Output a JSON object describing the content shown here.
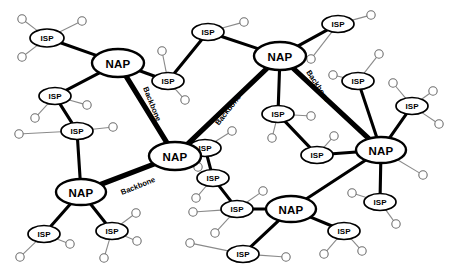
{
  "diagram": {
    "type": "network-diagram",
    "width": 450,
    "height": 275,
    "background_color": "#ffffff",
    "colors": {
      "backbone_link": "#000000",
      "isp_link": "#000000",
      "leaf_link": "#8a8a8a",
      "node_fill": "#ffffff",
      "node_stroke": "#000000",
      "leaf_stroke": "#6f6f6f",
      "label_text": "#000000"
    },
    "labels": {
      "nap": "NAP",
      "isp": "ISP",
      "backbone": "Backbone"
    },
    "nap_nodes": [
      {
        "id": "nap-top-left",
        "label": "NAP",
        "x": 118,
        "y": 63,
        "rx": 26,
        "ry": 14
      },
      {
        "id": "nap-top-right",
        "label": "NAP",
        "x": 280,
        "y": 56,
        "rx": 26,
        "ry": 14
      },
      {
        "id": "nap-center",
        "label": "NAP",
        "x": 175,
        "y": 156,
        "rx": 26,
        "ry": 14
      },
      {
        "id": "nap-left",
        "label": "NAP",
        "x": 81,
        "y": 192,
        "rx": 25,
        "ry": 13
      },
      {
        "id": "nap-right",
        "label": "NAP",
        "x": 381,
        "y": 150,
        "rx": 25,
        "ry": 13
      },
      {
        "id": "nap-bottom",
        "label": "NAP",
        "x": 291,
        "y": 209,
        "rx": 25,
        "ry": 13
      }
    ],
    "isp_nodes": [
      {
        "id": "isp-01",
        "label": "ISP",
        "x": 47,
        "y": 38,
        "rx": 17,
        "ry": 9
      },
      {
        "id": "isp-02",
        "label": "ISP",
        "x": 55,
        "y": 96,
        "rx": 16,
        "ry": 8.5
      },
      {
        "id": "isp-03",
        "label": "ISP",
        "x": 77,
        "y": 131,
        "rx": 16,
        "ry": 8.5
      },
      {
        "id": "isp-04",
        "label": "ISP",
        "x": 208,
        "y": 32,
        "rx": 16,
        "ry": 8.5
      },
      {
        "id": "isp-05",
        "label": "ISP",
        "x": 168,
        "y": 81,
        "rx": 16,
        "ry": 8.5
      },
      {
        "id": "isp-06",
        "label": "ISP",
        "x": 338,
        "y": 24,
        "rx": 16,
        "ry": 8.5
      },
      {
        "id": "isp-07",
        "label": "ISP",
        "x": 358,
        "y": 81,
        "rx": 16,
        "ry": 8.5
      },
      {
        "id": "isp-08",
        "label": "ISP",
        "x": 412,
        "y": 106,
        "rx": 16,
        "ry": 8.5
      },
      {
        "id": "isp-09",
        "label": "ISP",
        "x": 278,
        "y": 114,
        "rx": 16,
        "ry": 8.5
      },
      {
        "id": "isp-10",
        "label": "ISP",
        "x": 317,
        "y": 155,
        "rx": 16,
        "ry": 8.5
      },
      {
        "id": "isp-11",
        "label": "ISP",
        "x": 213,
        "y": 178,
        "rx": 16,
        "ry": 8.5
      },
      {
        "id": "isp-12",
        "label": "ISP",
        "x": 237,
        "y": 209,
        "rx": 16,
        "ry": 8.5
      },
      {
        "id": "isp-13",
        "label": "ISP",
        "x": 243,
        "y": 254,
        "rx": 16,
        "ry": 8.5
      },
      {
        "id": "isp-14",
        "label": "ISP",
        "x": 380,
        "y": 202,
        "rx": 16,
        "ry": 8.5
      },
      {
        "id": "isp-15",
        "label": "ISP",
        "x": 344,
        "y": 231,
        "rx": 16,
        "ry": 8.5
      },
      {
        "id": "isp-16",
        "label": "ISP",
        "x": 44,
        "y": 234,
        "rx": 16,
        "ry": 8.5
      },
      {
        "id": "isp-17",
        "label": "ISP",
        "x": 112,
        "y": 231,
        "rx": 16,
        "ry": 8.5
      },
      {
        "id": "isp-18",
        "label": "ISP",
        "x": 205,
        "y": 148,
        "rx": 16,
        "ry": 8.5
      }
    ],
    "backbone_links": [
      {
        "id": "bb-tl-center",
        "from": "nap-top-left",
        "to": "nap-center",
        "label": "Backbone",
        "label_x": 152,
        "label_y": 104,
        "label_rotation": 68
      },
      {
        "id": "bb-center-tr",
        "from": "nap-center",
        "to": "nap-top-right",
        "label": "Backbone",
        "label_x": 228,
        "label_y": 110,
        "label_rotation": -52
      },
      {
        "id": "bb-tr-right",
        "from": "nap-top-right",
        "to": "nap-right",
        "label": "Backbone",
        "label_x": 318,
        "label_y": 86,
        "label_rotation": 57
      },
      {
        "id": "bb-left-center",
        "from": "nap-left",
        "to": "nap-center",
        "label": "Backbone",
        "label_x": 138,
        "label_y": 186,
        "label_rotation": -22
      }
    ],
    "isp_links": [
      {
        "from": "isp-01",
        "to": "nap-top-left"
      },
      {
        "from": "isp-02",
        "to": "nap-top-left"
      },
      {
        "from": "isp-02",
        "to": "isp-03"
      },
      {
        "from": "isp-03",
        "to": "nap-left"
      },
      {
        "from": "isp-05",
        "to": "nap-top-left"
      },
      {
        "from": "isp-05",
        "to": "isp-04"
      },
      {
        "from": "isp-04",
        "to": "nap-top-right"
      },
      {
        "from": "isp-06",
        "to": "nap-top-right"
      },
      {
        "from": "isp-09",
        "to": "nap-top-right"
      },
      {
        "from": "isp-09",
        "to": "isp-10"
      },
      {
        "from": "isp-10",
        "to": "nap-right"
      },
      {
        "from": "isp-07",
        "to": "nap-right"
      },
      {
        "from": "isp-08",
        "to": "nap-right"
      },
      {
        "from": "isp-18",
        "to": "nap-center"
      },
      {
        "from": "isp-18",
        "to": "isp-11"
      },
      {
        "from": "isp-11",
        "to": "isp-12"
      },
      {
        "from": "isp-12",
        "to": "nap-bottom"
      },
      {
        "from": "isp-13",
        "to": "nap-bottom"
      },
      {
        "from": "nap-bottom",
        "to": "nap-right"
      },
      {
        "from": "isp-15",
        "to": "nap-bottom"
      },
      {
        "from": "isp-14",
        "to": "nap-right"
      },
      {
        "from": "isp-16",
        "to": "nap-left"
      },
      {
        "from": "isp-17",
        "to": "nap-left"
      }
    ],
    "leaf_nodes": [
      {
        "id": "leaf-01",
        "x": 22,
        "y": 19,
        "r": 4.2,
        "parent": "isp-01"
      },
      {
        "id": "leaf-02",
        "x": 82,
        "y": 21,
        "r": 4.2,
        "parent": "isp-01"
      },
      {
        "id": "leaf-03",
        "x": 22,
        "y": 57,
        "r": 4.2,
        "parent": "isp-01"
      },
      {
        "id": "leaf-04",
        "x": 87,
        "y": 105,
        "r": 4.2,
        "parent": "isp-02"
      },
      {
        "id": "leaf-05",
        "x": 35,
        "y": 118,
        "r": 4.2,
        "parent": "isp-02"
      },
      {
        "id": "leaf-06",
        "x": 19,
        "y": 134,
        "r": 4.2,
        "parent": "isp-03"
      },
      {
        "id": "leaf-07",
        "x": 113,
        "y": 127,
        "r": 4.2,
        "parent": "isp-03"
      },
      {
        "id": "leaf-08",
        "x": 162,
        "y": 51,
        "r": 4.2,
        "parent": "isp-05"
      },
      {
        "id": "leaf-09",
        "x": 185,
        "y": 100,
        "r": 4.2,
        "parent": "isp-05"
      },
      {
        "id": "leaf-10",
        "x": 244,
        "y": 22,
        "r": 4.2,
        "parent": "isp-04"
      },
      {
        "id": "leaf-11",
        "x": 311,
        "y": 59,
        "r": 4.2,
        "parent": "isp-06"
      },
      {
        "id": "leaf-12",
        "x": 371,
        "y": 15,
        "r": 4.2,
        "parent": "isp-06"
      },
      {
        "id": "leaf-13",
        "x": 379,
        "y": 54,
        "r": 4.2,
        "parent": "isp-07"
      },
      {
        "id": "leaf-14",
        "x": 333,
        "y": 75,
        "r": 4.2,
        "parent": "isp-07"
      },
      {
        "id": "leaf-15",
        "x": 393,
        "y": 83,
        "r": 4.2,
        "parent": "isp-08"
      },
      {
        "id": "leaf-16",
        "x": 433,
        "y": 91,
        "r": 4.2,
        "parent": "isp-08"
      },
      {
        "id": "leaf-17",
        "x": 439,
        "y": 124,
        "r": 4.2,
        "parent": "isp-08"
      },
      {
        "id": "leaf-18",
        "x": 311,
        "y": 116,
        "r": 4.2,
        "parent": "isp-09"
      },
      {
        "id": "leaf-19",
        "x": 272,
        "y": 138,
        "r": 4.2,
        "parent": "isp-09"
      },
      {
        "id": "leaf-20",
        "x": 334,
        "y": 136,
        "r": 4.2,
        "parent": "isp-10"
      },
      {
        "id": "leaf-21",
        "x": 232,
        "y": 131,
        "r": 4.2,
        "parent": "isp-18"
      },
      {
        "id": "leaf-22",
        "x": 198,
        "y": 167,
        "r": 4.2,
        "parent": "isp-18"
      },
      {
        "id": "leaf-23",
        "x": 196,
        "y": 198,
        "r": 4.2,
        "parent": "isp-11"
      },
      {
        "id": "leaf-24",
        "x": 263,
        "y": 191,
        "r": 4.2,
        "parent": "isp-12"
      },
      {
        "id": "leaf-25",
        "x": 193,
        "y": 212,
        "r": 4.2,
        "parent": "isp-12"
      },
      {
        "id": "leaf-26",
        "x": 215,
        "y": 233,
        "r": 4.2,
        "parent": "isp-12"
      },
      {
        "id": "leaf-27",
        "x": 190,
        "y": 243,
        "r": 4.2,
        "parent": "isp-13"
      },
      {
        "id": "leaf-28",
        "x": 286,
        "y": 257,
        "r": 4.2,
        "parent": "isp-13"
      },
      {
        "id": "leaf-29",
        "x": 352,
        "y": 193,
        "r": 4.2,
        "parent": "isp-14"
      },
      {
        "id": "leaf-30",
        "x": 396,
        "y": 224,
        "r": 4.2,
        "parent": "isp-14"
      },
      {
        "id": "leaf-31",
        "x": 324,
        "y": 254,
        "r": 4.2,
        "parent": "isp-15"
      },
      {
        "id": "leaf-32",
        "x": 362,
        "y": 251,
        "r": 4.2,
        "parent": "isp-15"
      },
      {
        "id": "leaf-33",
        "x": 20,
        "y": 257,
        "r": 4.2,
        "parent": "isp-16"
      },
      {
        "id": "leaf-34",
        "x": 70,
        "y": 244,
        "r": 4.2,
        "parent": "isp-16"
      },
      {
        "id": "leaf-35",
        "x": 136,
        "y": 213,
        "r": 4.2,
        "parent": "isp-17"
      },
      {
        "id": "leaf-36",
        "x": 137,
        "y": 241,
        "r": 4.2,
        "parent": "isp-17"
      },
      {
        "id": "leaf-37",
        "x": 104,
        "y": 258,
        "r": 4.2,
        "parent": "isp-17"
      },
      {
        "id": "leaf-38",
        "x": 423,
        "y": 175,
        "r": 4.2,
        "parent": "nap-right"
      }
    ]
  }
}
